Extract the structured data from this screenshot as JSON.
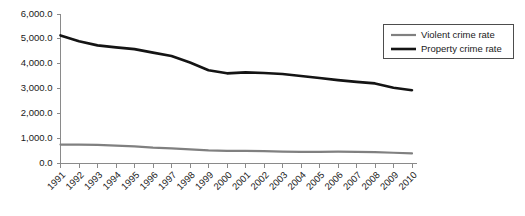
{
  "chart_data": {
    "type": "line",
    "title": "",
    "subtitle": "",
    "xlabel": "",
    "ylabel": "",
    "grid": false,
    "legend_position": "top-right",
    "categories": [
      "1991",
      "1992",
      "1993",
      "1994",
      "1995",
      "1996",
      "1997",
      "1998",
      "1999",
      "2000",
      "2001",
      "2002",
      "2003",
      "2004",
      "2005",
      "2006",
      "2007",
      "2008",
      "2009",
      "2010"
    ],
    "ylim": [
      0,
      6000
    ],
    "ytick_labels": [
      "0.0",
      "1,000.0",
      "2,000.0",
      "3,000.0",
      "4,000.0",
      "5,000.0",
      "6,000.0"
    ],
    "ytick_values": [
      0,
      1000,
      2000,
      3000,
      4000,
      5000,
      6000
    ],
    "series": [
      {
        "name": "Violent crime rate",
        "color": "#808080",
        "width": 2.2,
        "values": [
          758.2,
          757.7,
          747.1,
          713.6,
          684.5,
          636.6,
          611.0,
          567.6,
          523.0,
          506.5,
          504.5,
          494.4,
          475.8,
          463.2,
          469.0,
          473.6,
          466.9,
          454.5,
          431.9,
          404.5
        ]
      },
      {
        "name": "Property crime rate",
        "color": "#141414",
        "width": 2.6,
        "values": [
          5140.2,
          4903.7,
          4740.0,
          4660.2,
          4590.5,
          4451.0,
          4316.3,
          4052.5,
          3743.6,
          3618.3,
          3658.1,
          3630.6,
          3591.2,
          3514.1,
          3431.5,
          3346.6,
          3276.4,
          3214.6,
          3041.3,
          2941.9
        ]
      }
    ],
    "legend": [
      {
        "label": "Violent crime rate",
        "color": "#808080",
        "width": 2.2
      },
      {
        "label": "Property crime rate",
        "color": "#141414",
        "width": 2.6
      }
    ]
  }
}
